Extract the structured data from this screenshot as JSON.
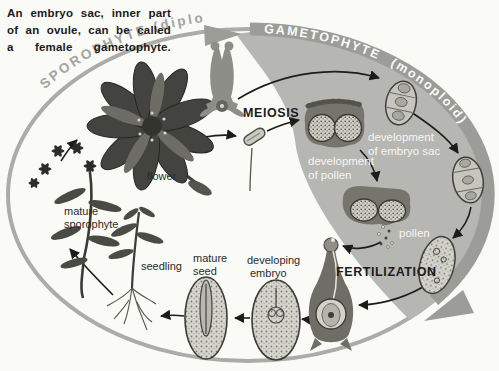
{
  "caption": {
    "lines": [
      "An embryo sac, inner part",
      "of an ovule, can be called",
      "a female gametophyte."
    ]
  },
  "arcs": {
    "sporophyte": "SPOROPHYTE (diploid)",
    "gametophyte": "GAMETOPHYTE (monoploid)"
  },
  "process_labels": {
    "meiosis": "MEIOSIS",
    "fertilization": "FERTILIZATION"
  },
  "stage_labels": {
    "flower": "flower",
    "mature_sporophyte": [
      "mature",
      "sporophyte"
    ],
    "seedling": "seedling",
    "mature_seed": [
      "mature",
      "seed"
    ],
    "developing_embryo": [
      "developing",
      "embryo"
    ],
    "development_of_pollen": [
      "development",
      "of pollen"
    ],
    "development_of_embryo_sac": [
      "development",
      "of embryo sac"
    ],
    "pollen": "pollen"
  },
  "colors": {
    "background": "#fafaf7",
    "wedge_gray": "#b6b6b2",
    "band_gray": "#9c9c98",
    "ring_gray": "#ababa7",
    "ink": "#1c1c1a",
    "white_text": "#f7f7f2"
  }
}
